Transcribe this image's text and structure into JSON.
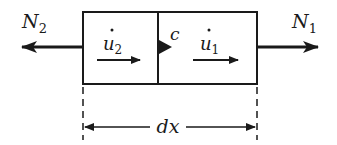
{
  "diagram": {
    "type": "free-body element",
    "element": {
      "left_region": {
        "velocity_label": "u",
        "velocity_subscript": "2",
        "dot": "true"
      },
      "right_region": {
        "velocity_label": "u",
        "velocity_subscript": "1",
        "dot": "true"
      },
      "interface_label": "c"
    },
    "forces": {
      "left": {
        "label": "N",
        "subscript": "2",
        "direction": "left"
      },
      "right": {
        "label": "N",
        "subscript": "1",
        "direction": "right"
      }
    },
    "dimension": {
      "label": "dx"
    }
  },
  "colors": {
    "ink": "#1a1a1a",
    "background": "#ffffff"
  }
}
